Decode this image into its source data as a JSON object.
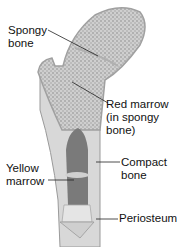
{
  "diagram": {
    "labels": {
      "spongy_bone": [
        "Spongy",
        "bone"
      ],
      "red_marrow": [
        "Red marrow",
        "(in spongy",
        "bone)"
      ],
      "yellow_marrow": [
        "Yellow",
        "marrow"
      ],
      "compact_bone": [
        "Compact",
        "bone"
      ],
      "periosteum": [
        "Periosteum"
      ]
    },
    "colors": {
      "background": "#ffffff",
      "bone_fill": "#c9c9c9",
      "spongy_texture": "#8a8a8a",
      "marrow_cavity": "#6e6e6e",
      "outline": "#9a9a9a",
      "leader_line": "#222222",
      "text": "#111111"
    }
  }
}
